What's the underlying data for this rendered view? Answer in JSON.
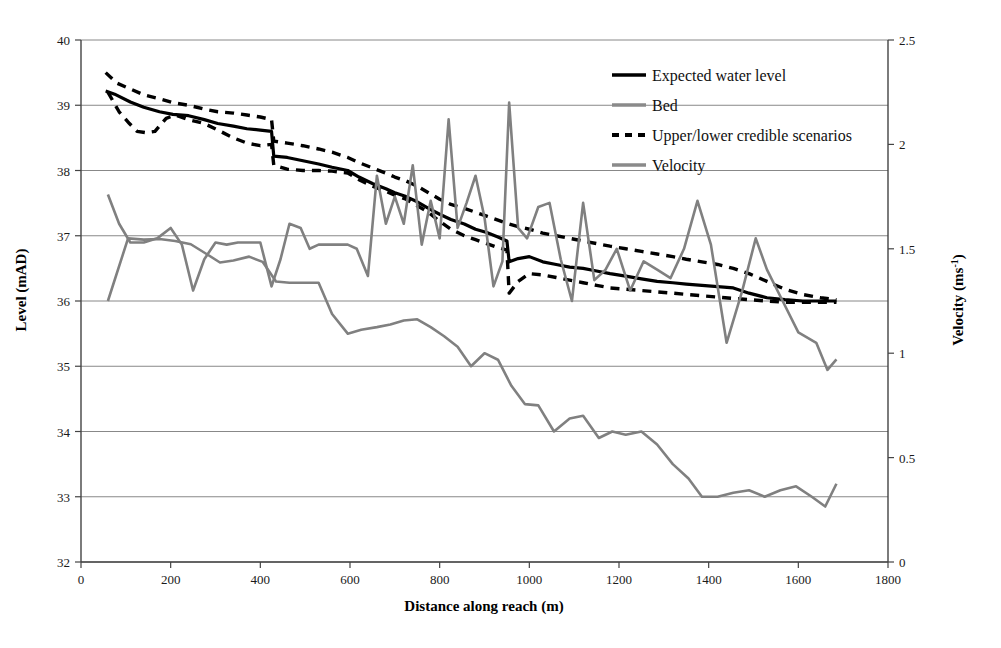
{
  "chart_data": {
    "type": "line",
    "title": "",
    "xlabel": "Distance along reach (m)",
    "ylabel": "Level  (mAD)",
    "y2label": "Velocity (ms-1)",
    "y2label_base": "Velocity (ms",
    "y2label_exponent": "-1",
    "y2label_close": ")",
    "xlim": [
      0,
      1800
    ],
    "ylim": [
      32,
      40
    ],
    "y2lim": [
      0,
      2.5
    ],
    "xticks": [
      0,
      200,
      400,
      600,
      800,
      1000,
      1200,
      1400,
      1600,
      1800
    ],
    "xtick_labels": [
      "0",
      "200",
      "400",
      "600",
      "800",
      "1000",
      "1200",
      "1400",
      "1600",
      "1800"
    ],
    "yticks": [
      32,
      33,
      34,
      35,
      36,
      37,
      38,
      39,
      40
    ],
    "ytick_labels": [
      "32",
      "33",
      "34",
      "35",
      "36",
      "37",
      "38",
      "39",
      "40"
    ],
    "y2ticks": [
      0,
      0.5,
      1,
      1.5,
      2,
      2.5
    ],
    "y2tick_labels": [
      "0",
      "0.5",
      "1",
      "1.5",
      "2",
      "2.5"
    ],
    "grid": "horizontal",
    "legend_position": "top-right",
    "colors": {
      "expected_water_level": "#000000",
      "bed": "#808080",
      "credible_scenarios": "#000000",
      "velocity": "#808080",
      "gridline": "#888888",
      "axis": "#444444"
    },
    "series": [
      {
        "name": "Expected water level",
        "axis": "left",
        "style": "solid",
        "color": "#000000",
        "x": [
          55,
          75,
          110,
          140,
          175,
          205,
          240,
          275,
          305,
          340,
          370,
          400,
          425,
          430,
          460,
          495,
          530,
          560,
          595,
          620,
          650,
          680,
          700,
          725,
          750,
          775,
          800,
          825,
          855,
          880,
          905,
          930,
          950,
          955,
          975,
          1000,
          1030,
          1060,
          1090,
          1120,
          1150,
          1180,
          1215,
          1250,
          1285,
          1320,
          1350,
          1385,
          1420,
          1455,
          1490,
          1530,
          1570,
          1610,
          1650,
          1685
        ],
        "y": [
          39.22,
          39.17,
          39.05,
          38.97,
          38.9,
          38.86,
          38.84,
          38.78,
          38.72,
          38.68,
          38.64,
          38.62,
          38.6,
          38.22,
          38.2,
          38.15,
          38.1,
          38.05,
          38.0,
          37.9,
          37.8,
          37.72,
          37.66,
          37.6,
          37.52,
          37.42,
          37.33,
          37.25,
          37.18,
          37.1,
          37.05,
          36.98,
          36.92,
          36.6,
          36.65,
          36.68,
          36.6,
          36.56,
          36.52,
          36.5,
          36.46,
          36.42,
          36.38,
          36.34,
          36.3,
          36.28,
          36.26,
          36.24,
          36.22,
          36.2,
          36.12,
          36.05,
          36.02,
          36.0,
          36.0,
          36.0
        ]
      },
      {
        "name": "Upper credible scenario",
        "axis": "left",
        "style": "dashed",
        "color": "#000000",
        "x": [
          55,
          80,
          110,
          140,
          175,
          205,
          240,
          275,
          305,
          340,
          370,
          400,
          425,
          430,
          460,
          495,
          530,
          560,
          595,
          620,
          650,
          680,
          700,
          725,
          750,
          775,
          800,
          825,
          855,
          880,
          905,
          930,
          955,
          975,
          1000,
          1030,
          1060,
          1090,
          1120,
          1150,
          1180,
          1215,
          1250,
          1285,
          1320,
          1350,
          1385,
          1420,
          1455,
          1490,
          1530,
          1570,
          1610,
          1650,
          1685
        ],
        "y": [
          39.5,
          39.34,
          39.25,
          39.16,
          39.1,
          39.04,
          39.0,
          38.94,
          38.9,
          38.88,
          38.85,
          38.82,
          38.78,
          38.45,
          38.42,
          38.38,
          38.33,
          38.28,
          38.2,
          38.12,
          38.04,
          37.96,
          37.9,
          37.84,
          37.76,
          37.66,
          37.56,
          37.48,
          37.42,
          37.36,
          37.3,
          37.24,
          37.18,
          37.14,
          37.1,
          37.04,
          37.0,
          36.96,
          36.92,
          36.88,
          36.84,
          36.8,
          36.76,
          36.72,
          36.68,
          36.64,
          36.6,
          36.56,
          36.5,
          36.42,
          36.3,
          36.18,
          36.1,
          36.05,
          36.02
        ]
      },
      {
        "name": "Lower credible scenario",
        "axis": "left",
        "style": "dashed",
        "color": "#000000",
        "x": [
          60,
          85,
          108,
          125,
          145,
          165,
          190,
          210,
          240,
          275,
          305,
          340,
          370,
          400,
          425,
          430,
          460,
          495,
          530,
          560,
          595,
          620,
          650,
          680,
          700,
          725,
          750,
          775,
          800,
          825,
          855,
          880,
          905,
          930,
          950,
          955,
          975,
          1000,
          1030,
          1060,
          1090,
          1120,
          1150,
          1180,
          1215,
          1250,
          1285,
          1320,
          1350,
          1385,
          1420,
          1455,
          1490,
          1530,
          1570,
          1610,
          1650,
          1685
        ],
        "y": [
          39.2,
          38.9,
          38.72,
          38.6,
          38.58,
          38.6,
          38.8,
          38.85,
          38.78,
          38.72,
          38.62,
          38.5,
          38.42,
          38.38,
          38.4,
          38.08,
          38.02,
          38.0,
          38.0,
          37.99,
          37.96,
          37.86,
          37.76,
          37.68,
          37.62,
          37.56,
          37.46,
          37.36,
          37.22,
          37.1,
          37.0,
          36.94,
          36.88,
          36.82,
          36.78,
          36.12,
          36.3,
          36.42,
          36.4,
          36.36,
          36.32,
          36.28,
          36.24,
          36.2,
          36.18,
          36.16,
          36.14,
          36.12,
          36.1,
          36.08,
          36.06,
          36.04,
          36.02,
          36.0,
          35.98,
          35.98,
          35.98,
          35.98
        ]
      },
      {
        "name": "Bed",
        "axis": "left",
        "style": "solid",
        "color": "#808080",
        "x": [
          60,
          105,
          140,
          175,
          210,
          245,
          280,
          310,
          340,
          375,
          405,
          435,
          465,
          500,
          530,
          560,
          595,
          625,
          660,
          690,
          720,
          750,
          780,
          810,
          840,
          870,
          900,
          930,
          960,
          990,
          1020,
          1055,
          1090,
          1120,
          1155,
          1185,
          1215,
          1250,
          1285,
          1320,
          1355,
          1385,
          1420,
          1455,
          1490,
          1525,
          1560,
          1595,
          1630,
          1660,
          1685
        ],
        "y": [
          36.0,
          36.96,
          36.94,
          36.95,
          36.92,
          36.87,
          36.72,
          36.59,
          36.62,
          36.68,
          36.6,
          36.3,
          36.28,
          36.28,
          36.28,
          35.8,
          35.5,
          35.56,
          35.6,
          35.64,
          35.7,
          35.72,
          35.6,
          35.46,
          35.3,
          35.0,
          35.2,
          35.1,
          34.7,
          34.42,
          34.4,
          34.0,
          34.2,
          34.24,
          33.9,
          34.0,
          33.95,
          34.0,
          33.8,
          33.5,
          33.28,
          33.0,
          33.0,
          33.06,
          33.1,
          33.0,
          33.1,
          33.16,
          33.0,
          32.85,
          33.2
        ]
      },
      {
        "name": "Velocity",
        "axis": "right",
        "style": "solid",
        "color": "#808080",
        "x": [
          60,
          85,
          110,
          140,
          170,
          200,
          225,
          250,
          275,
          300,
          325,
          350,
          375,
          400,
          425,
          445,
          465,
          490,
          510,
          530,
          550,
          570,
          595,
          615,
          640,
          660,
          680,
          700,
          720,
          740,
          760,
          780,
          800,
          820,
          840,
          860,
          880,
          900,
          920,
          940,
          955,
          975,
          995,
          1020,
          1045,
          1070,
          1095,
          1120,
          1145,
          1170,
          1195,
          1225,
          1255,
          1285,
          1315,
          1345,
          1375,
          1405,
          1440,
          1475,
          1505,
          1530,
          1565,
          1600,
          1640,
          1665,
          1685
        ],
        "y": [
          1.76,
          1.62,
          1.53,
          1.53,
          1.55,
          1.6,
          1.52,
          1.3,
          1.45,
          1.53,
          1.52,
          1.53,
          1.53,
          1.53,
          1.32,
          1.45,
          1.62,
          1.6,
          1.5,
          1.52,
          1.52,
          1.52,
          1.52,
          1.5,
          1.37,
          1.85,
          1.62,
          1.75,
          1.62,
          1.9,
          1.52,
          1.73,
          1.55,
          2.12,
          1.6,
          1.72,
          1.85,
          1.65,
          1.32,
          1.44,
          2.2,
          1.6,
          1.55,
          1.7,
          1.72,
          1.45,
          1.25,
          1.72,
          1.35,
          1.4,
          1.5,
          1.3,
          1.44,
          1.4,
          1.36,
          1.5,
          1.73,
          1.52,
          1.05,
          1.3,
          1.55,
          1.4,
          1.25,
          1.1,
          1.05,
          0.92,
          0.97
        ]
      }
    ],
    "legend": [
      {
        "label": "Expected water level",
        "marker": "solid-black",
        "color": "#000000"
      },
      {
        "label": "Bed",
        "marker": "solid-gray",
        "color": "#8a8a8a"
      },
      {
        "label": "Upper/lower credible scenarios",
        "marker": "dashed-black",
        "color": "#000000"
      },
      {
        "label": "Velocity",
        "marker": "solid-gray",
        "color": "#8a8a8a"
      }
    ]
  }
}
